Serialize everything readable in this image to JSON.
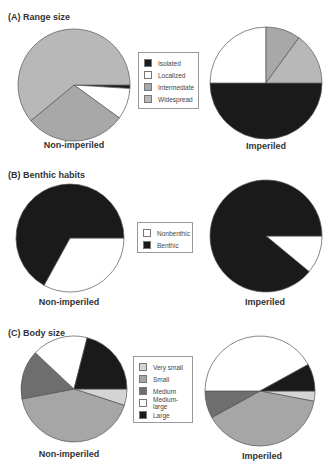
{
  "chart_data": [
    {
      "type": "pie",
      "title": "(A) Range size",
      "legend": [
        "Isolated",
        "Localized",
        "Intermediate",
        "Widespread"
      ],
      "colors": [
        "#1a1a1a",
        "#ffffff",
        "#a8a8a8",
        "#b8b8b8"
      ],
      "pies": [
        {
          "label": "Non-imperiled",
          "categories": [
            "Isolated",
            "Localized",
            "Intermediate",
            "Widespread"
          ],
          "values": [
            1,
            9,
            29,
            61
          ]
        },
        {
          "label": "Imperiled",
          "categories": [
            "Isolated",
            "Localized",
            "Intermediate",
            "Widespread"
          ],
          "values": [
            50,
            25,
            10,
            15
          ]
        }
      ],
      "legend_position": "center"
    },
    {
      "type": "pie",
      "title": "(B) Benthic habits",
      "legend": [
        "Nonbenthic",
        "Benthic"
      ],
      "colors": [
        "#ffffff",
        "#1a1a1a"
      ],
      "pies": [
        {
          "label": "Non-imperiled",
          "categories": [
            "Nonbenthic",
            "Benthic"
          ],
          "values": [
            33,
            67
          ]
        },
        {
          "label": "Imperiled",
          "categories": [
            "Nonbenthic",
            "Benthic"
          ],
          "values": [
            11,
            89
          ]
        }
      ],
      "legend_position": "center"
    },
    {
      "type": "pie",
      "title": "(C) Body size",
      "legend": [
        "Very small",
        "Small",
        "Medium",
        "Medium-large",
        "Large"
      ],
      "colors": [
        "#d4d4d4",
        "#a6a6a6",
        "#6e6e6e",
        "#ffffff",
        "#1a1a1a"
      ],
      "pies": [
        {
          "label": "Non-imperiled",
          "categories": [
            "Very small",
            "Small",
            "Medium",
            "Medium-large",
            "Large"
          ],
          "values": [
            5,
            42,
            15,
            17,
            21
          ]
        },
        {
          "label": "Imperiled",
          "categories": [
            "Very small",
            "Small",
            "Medium",
            "Medium-large",
            "Large"
          ],
          "values": [
            3,
            39,
            8,
            42,
            8
          ]
        }
      ],
      "legend_position": "center"
    }
  ],
  "panels": [
    {
      "title": "(A) Range size",
      "left_label": "Non-imperiled",
      "right_label": "Imperiled",
      "legend": [
        "Isolated",
        "Localized",
        "Intermediate",
        "Widespread"
      ]
    },
    {
      "title": "(B) Benthic habits",
      "left_label": "Non-imperiled",
      "right_label": "Imperiled",
      "legend": [
        "Nonbenthic",
        "Benthic"
      ]
    },
    {
      "title": "(C) Body size",
      "left_label": "Non-imperiled",
      "right_label": "Imperiled",
      "legend": [
        "Very small",
        "Small",
        "Medium",
        "Medium-large",
        "Large"
      ]
    }
  ]
}
